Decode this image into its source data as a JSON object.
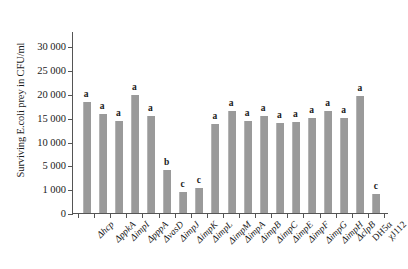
{
  "chart_data": {
    "type": "bar",
    "title": "",
    "xlabel": "",
    "ylabel": "Surviving E.coli prey in CFU/ml",
    "ylim": [
      0,
      30000
    ],
    "grid": false,
    "legend": "none",
    "ytick_labels": [
      "0",
      "1 000",
      "5 000",
      "10 000",
      "15 000",
      "20 000",
      "25 000",
      "30 000"
    ],
    "ytick_values": [
      0,
      1000,
      5000,
      10000,
      15000,
      20000,
      25000,
      30000
    ],
    "bar_color": "#9a9a9a",
    "categories": [
      "Δhcp",
      "ΔppkA",
      "ΔimpI",
      "ΔpppA",
      "ΔvasD",
      "ΔimpJ",
      "ΔimpK",
      "ΔimpL",
      "ΔimpM",
      "ΔimpA",
      "ΔimpB",
      "ΔimpC",
      "ΔimpE",
      "ΔimpF",
      "ΔimpG",
      "ΔimpH",
      "ΔclpB",
      "DH5α",
      "χJ112"
    ],
    "values": [
      18400,
      15900,
      14300,
      19700,
      15400,
      4300,
      900,
      1200,
      13700,
      16400,
      14300,
      15300,
      13900,
      14200,
      15000,
      16500,
      15000,
      19600,
      800
    ],
    "significance_letters": [
      "a",
      "a",
      "a",
      "a",
      "a",
      "b",
      "c",
      "c",
      "a",
      "a",
      "a",
      "a",
      "a",
      "a",
      "a",
      "a",
      "a",
      "a",
      "c"
    ]
  }
}
